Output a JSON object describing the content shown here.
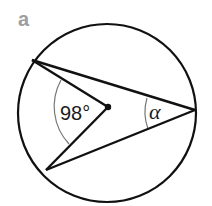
{
  "figure": {
    "part_label": "a",
    "central_angle_label": "98°",
    "inscribed_angle_label": "α"
  },
  "colors": {
    "lines": "#111111",
    "arcs": "#777777",
    "part_label": "#9e9e9e"
  }
}
